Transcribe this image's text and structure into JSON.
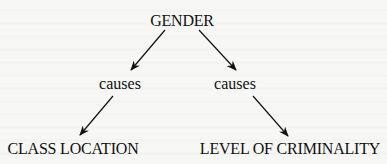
{
  "diagram": {
    "type": "causal-tree",
    "root": {
      "label": "GENDER"
    },
    "branches": [
      {
        "relation": "causes",
        "target": "CLASS LOCATION"
      },
      {
        "relation": "causes",
        "target": "LEVEL OF CRIMINALITY"
      }
    ]
  },
  "colors": {
    "ink": "#111111",
    "background": "#f7f7f5"
  }
}
